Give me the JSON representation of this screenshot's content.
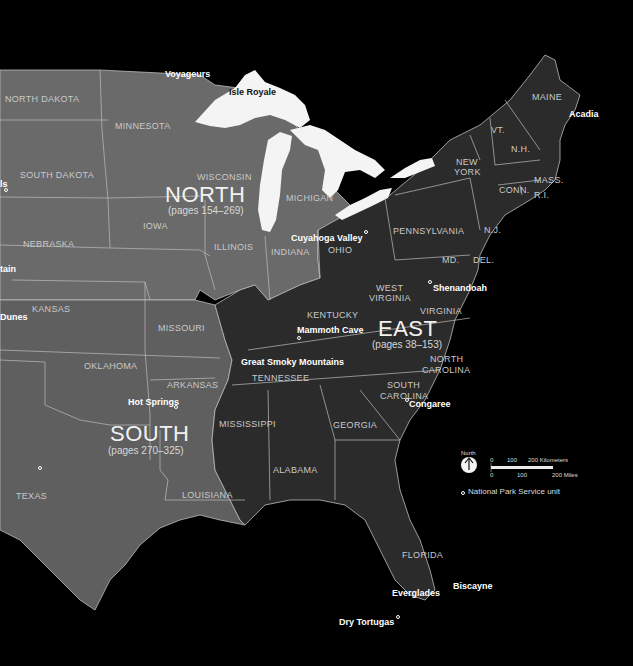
{
  "map": {
    "colors": {
      "ocean": "#000000",
      "north_region": "#6b6b6b",
      "south_region": "#5e5e5e",
      "east_region": "#2a2a2a",
      "lakes": "#f4f4f4",
      "borders": "#bdbdbd",
      "west_edge": "#8a8a8a"
    },
    "regions": [
      {
        "name": "NORTH",
        "pages": "(pages 154–269)"
      },
      {
        "name": "EAST",
        "pages": "(pages 38–153)"
      },
      {
        "name": "SOUTH",
        "pages": "(pages 270–325)"
      }
    ],
    "states": [
      "NORTH DAKOTA",
      "MINNESOTA",
      "SOUTH DAKOTA",
      "WISCONSIN",
      "MICHIGAN",
      "NEBRASKA",
      "IOWA",
      "ILLINOIS",
      "INDIANA",
      "OHIO",
      "KANSAS",
      "MISSOURI",
      "OKLAHOMA",
      "ARKANSAS",
      "TEXAS",
      "LOUISIANA",
      "MISSISSIPPI",
      "ALABAMA",
      "GEORGIA",
      "FLORIDA",
      "TENNESSEE",
      "KENTUCKY",
      "WEST VIRGINIA",
      "VIRGINIA",
      "NORTH CAROLINA",
      "SOUTH CAROLINA",
      "PENNSYLVANIA",
      "NEW YORK",
      "MD.",
      "DEL.",
      "N.J.",
      "CONN.",
      "R.I.",
      "MASS.",
      "VT.",
      "N.H.",
      "MAINE"
    ],
    "parks": [
      "Voyageurs",
      "Isle Royale",
      "Cuyahoga Valley",
      "Shenandoah",
      "Mammoth Cave",
      "Great Smoky Mountains",
      "Hot Springs",
      "Congaree",
      "Acadia",
      "Everglades",
      "Biscayne",
      "Dry Tortugas"
    ],
    "cutoff_labels": [
      "ls",
      "tain",
      "Dunes"
    ]
  },
  "labels": {
    "north_dakota": "NORTH DAKOTA",
    "minnesota": "MINNESOTA",
    "south_dakota": "SOUTH DAKOTA",
    "wisconsin": "WISCONSIN",
    "michigan": "MICHIGAN",
    "nebraska": "NEBRASKA",
    "iowa": "IOWA",
    "illinois": "ILLINOIS",
    "indiana": "INDIANA",
    "ohio": "OHIO",
    "kansas": "KANSAS",
    "missouri": "MISSOURI",
    "oklahoma": "OKLAHOMA",
    "arkansas": "ARKANSAS",
    "texas": "TEXAS",
    "louisiana": "LOUISIANA",
    "mississippi": "MISSISSIPPI",
    "alabama": "ALABAMA",
    "georgia": "GEORGIA",
    "florida": "FLORIDA",
    "tennessee": "TENNESSEE",
    "kentucky": "KENTUCKY",
    "west": "WEST",
    "virginia_w": "VIRGINIA",
    "virginia": "VIRGINIA",
    "north": "NORTH",
    "carolina_n": "CAROLINA",
    "south": "SOUTH",
    "carolina_s": "CAROLINA",
    "pennsylvania": "PENNSYLVANIA",
    "new": "NEW",
    "york": "YORK",
    "md": "MD.",
    "del": "DEL.",
    "nj": "N.J.",
    "conn": "CONN.",
    "ri": "R.I.",
    "mass": "MASS.",
    "vt": "VT.",
    "nh": "N.H.",
    "maine": "MAINE"
  },
  "region_labels": {
    "north": {
      "name": "NORTH",
      "pages": "(pages 154–269)"
    },
    "east": {
      "name": "EAST",
      "pages": "(pages 38–153)"
    },
    "south": {
      "name": "SOUTH",
      "pages": "(pages 270–325)"
    }
  },
  "parks": {
    "voyageurs": "Voyageurs",
    "isle_royale": "Isle Royale",
    "cuyahoga": "Cuyahoga Valley",
    "shenandoah": "Shenandoah",
    "mammoth": "Mammoth Cave",
    "smoky": "Great Smoky Mountains",
    "hot_springs": "Hot Springs",
    "congaree": "Congaree",
    "acadia": "Acadia",
    "everglades": "Everglades",
    "biscayne": "Biscayne",
    "dry_tortugas": "Dry Tortugas",
    "cut_ls": "ls",
    "cut_tain": "tain",
    "cut_dunes": "Dunes"
  },
  "legend": {
    "north_label": "North",
    "scale_km": [
      "0",
      "100",
      "200 Kilometers"
    ],
    "scale_mi": [
      "0",
      "100",
      "200 Miles"
    ],
    "nps_unit": "National Park Service unit"
  }
}
